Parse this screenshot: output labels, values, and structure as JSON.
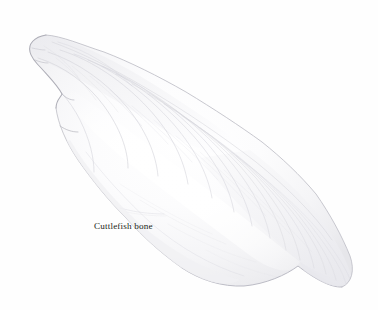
{
  "page": {
    "background_color": "#fefefe",
    "width": 378,
    "height": 310,
    "kind": "scientific-illustration-plate"
  },
  "caption": {
    "text": "Cuttlefish bone",
    "color": "#231f20",
    "x": 94,
    "y": 221,
    "font_size_px": 9.2
  },
  "specimen": {
    "name": "cuttlefish-bone",
    "common_label": "Cuttlefish bone",
    "medium": "pencil-and-wash-drawing",
    "orientation": "diagonal-upper-left-to-lower-right",
    "bounds": {
      "x1": 27,
      "y1": 34,
      "x2": 357,
      "y2": 289
    },
    "colors": {
      "body_fill": "#fbfbfc",
      "shadow_low": "#f2f2f4",
      "shadow_mid": "#e4e4e8",
      "edge_line": "#c6c6cc",
      "edge_dark": "#a9a9b1",
      "ridge_line": "#d6d6dc",
      "highlight": "#ffffff"
    },
    "features": [
      {
        "name": "blunt-anterior-end",
        "position": "upper-left"
      },
      {
        "name": "notched-left-margin",
        "position": "left"
      },
      {
        "name": "concentric-growth-ridges",
        "position": "body-interior"
      },
      {
        "name": "central-highlight-ridge",
        "position": "center"
      },
      {
        "name": "tapered-posterior-tip",
        "position": "lower-right"
      },
      {
        "name": "rounded-ventral-lobe",
        "position": "lower-right"
      }
    ],
    "outline_points": [
      [
        30,
        52
      ],
      [
        28,
        44
      ],
      [
        34,
        38
      ],
      [
        46,
        35
      ],
      [
        62,
        38
      ],
      [
        82,
        45
      ],
      [
        104,
        52
      ],
      [
        130,
        62
      ],
      [
        158,
        76
      ],
      [
        186,
        92
      ],
      [
        214,
        109
      ],
      [
        240,
        126
      ],
      [
        262,
        142
      ],
      [
        282,
        158
      ],
      [
        300,
        175
      ],
      [
        316,
        194
      ],
      [
        330,
        214
      ],
      [
        342,
        236
      ],
      [
        350,
        256
      ],
      [
        355,
        272
      ],
      [
        352,
        283
      ],
      [
        342,
        287
      ],
      [
        328,
        284
      ],
      [
        310,
        274
      ],
      [
        292,
        261
      ],
      [
        274,
        274
      ],
      [
        252,
        283
      ],
      [
        230,
        286
      ],
      [
        208,
        282
      ],
      [
        188,
        272
      ],
      [
        170,
        258
      ],
      [
        152,
        242
      ],
      [
        134,
        224
      ],
      [
        116,
        206
      ],
      [
        100,
        188
      ],
      [
        86,
        170
      ],
      [
        74,
        152
      ],
      [
        64,
        134
      ],
      [
        58,
        118
      ],
      [
        56,
        104
      ],
      [
        62,
        96
      ],
      [
        58,
        86
      ],
      [
        50,
        78
      ],
      [
        44,
        70
      ],
      [
        34,
        62
      ]
    ],
    "growth_ridges_count": 16
  }
}
